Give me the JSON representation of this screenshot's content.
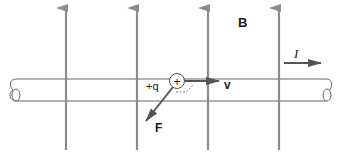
{
  "diagram": {
    "type": "physics-magnetic-force-on-moving-charge",
    "labels": {
      "field": "B",
      "current": "I",
      "charge": "+q",
      "charge_symbol": "+",
      "velocity": "v",
      "force": "F"
    },
    "field_lines": {
      "count": 4,
      "direction": "up",
      "x_positions": [
        66,
        137,
        208,
        279
      ]
    },
    "colors": {
      "field_line": "#8c8c8c",
      "arrow": "#555555",
      "outline": "#555555",
      "text": "#1a1a1a",
      "background": "#ffffff"
    }
  }
}
